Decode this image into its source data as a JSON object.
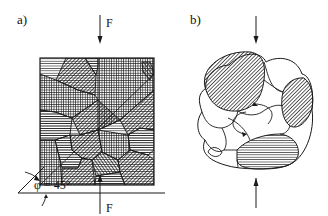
{
  "figure": {
    "panel_a": {
      "label": "a)",
      "force_top_label": "F",
      "force_bottom_label": "F",
      "angle_label": "φ = 45°",
      "angle_symbol": "φ",
      "angle_value": "45",
      "angle_unit": "°"
    },
    "panel_b": {
      "label": "b)"
    },
    "colors": {
      "line": "#1a1a1a",
      "background": "#ffffff"
    }
  }
}
